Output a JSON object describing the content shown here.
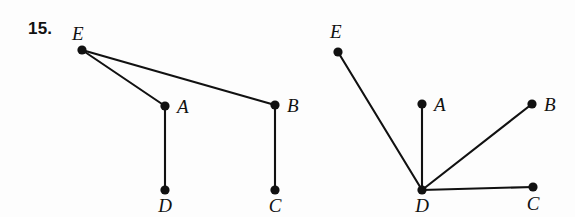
{
  "problem": {
    "number": "15."
  },
  "background_color": "#fdfdfd",
  "ink_color": "#111111",
  "graphs": [
    {
      "name": "left-graph",
      "vertices": [
        {
          "id": "E",
          "label": "E",
          "x": 82,
          "y": 50,
          "label_x": 72,
          "label_y": 40
        },
        {
          "id": "A",
          "label": "A",
          "x": 165,
          "y": 106,
          "label_x": 177,
          "label_y": 113
        },
        {
          "id": "B",
          "label": "B",
          "x": 275,
          "y": 105,
          "label_x": 287,
          "label_y": 112
        },
        {
          "id": "D",
          "label": "D",
          "x": 165,
          "y": 190,
          "label_x": 165,
          "label_y": 212
        },
        {
          "id": "C",
          "label": "C",
          "x": 275,
          "y": 190,
          "label_x": 275,
          "label_y": 212
        }
      ],
      "edges": [
        {
          "from": "E",
          "to": "A"
        },
        {
          "from": "E",
          "to": "B"
        },
        {
          "from": "A",
          "to": "D"
        },
        {
          "from": "B",
          "to": "C"
        }
      ]
    },
    {
      "name": "right-graph",
      "vertices": [
        {
          "id": "E",
          "label": "E",
          "x": 338,
          "y": 52,
          "label_x": 330,
          "label_y": 38
        },
        {
          "id": "A",
          "label": "A",
          "x": 422,
          "y": 104,
          "label_x": 434,
          "label_y": 111
        },
        {
          "id": "B",
          "label": "B",
          "x": 532,
          "y": 104,
          "label_x": 544,
          "label_y": 111
        },
        {
          "id": "D",
          "label": "D",
          "x": 422,
          "y": 190,
          "label_x": 422,
          "label_y": 212
        },
        {
          "id": "C",
          "label": "C",
          "x": 533,
          "y": 187,
          "label_x": 533,
          "label_y": 210
        }
      ],
      "edges": [
        {
          "from": "E",
          "to": "D"
        },
        {
          "from": "A",
          "to": "D"
        },
        {
          "from": "B",
          "to": "D"
        },
        {
          "from": "C",
          "to": "D"
        }
      ]
    }
  ]
}
